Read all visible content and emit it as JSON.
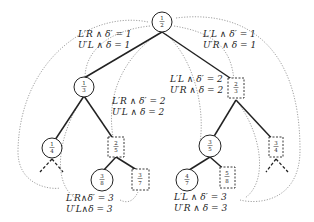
{
  "diagram": {
    "type": "binary-tree",
    "nodes": {
      "root": {
        "num": "1",
        "den": "2",
        "shape": "circle"
      },
      "l": {
        "num": "1",
        "den": "3",
        "shape": "circle"
      },
      "r": {
        "num": "2",
        "den": "3",
        "shape": "dashed-box"
      },
      "ll": {
        "num": "1",
        "den": "4",
        "shape": "circle"
      },
      "lr": {
        "num": "2",
        "den": "5",
        "shape": "dashed-box"
      },
      "rl": {
        "num": "3",
        "den": "5",
        "shape": "circle"
      },
      "rr": {
        "num": "3",
        "den": "4",
        "shape": "dashed-box"
      },
      "lrl": {
        "num": "3",
        "den": "8",
        "shape": "circle"
      },
      "lrr": {
        "num": "3",
        "den": "7",
        "shape": "dashed-box"
      },
      "rll": {
        "num": "4",
        "den": "7",
        "shape": "circle"
      },
      "rlr": {
        "num": "5",
        "den": "8",
        "shape": "dashed-box"
      }
    },
    "labels": {
      "top_left_1": "L′R ∧ δ′ = 1",
      "top_left_2": "U′L ∧ δ = 1",
      "top_right_1": "L′L ∧ δ′ = 1",
      "top_right_2": "U′R ∧ δ = 1",
      "mid_left_1": "L′R ∧ δ′ = 2",
      "mid_left_2": "U′L ∧ δ = 2",
      "mid_right_1": "L′L ∧ δ′ = 2",
      "mid_right_2": "U′R ∧ δ = 2",
      "bot_left_1": "L′R∧δ′ = 3",
      "bot_left_2": "U′L∧δ = 3",
      "bot_right_1": "L′L ∧ δ′ = 3",
      "bot_right_2": "U′R ∧ δ = 3"
    }
  }
}
